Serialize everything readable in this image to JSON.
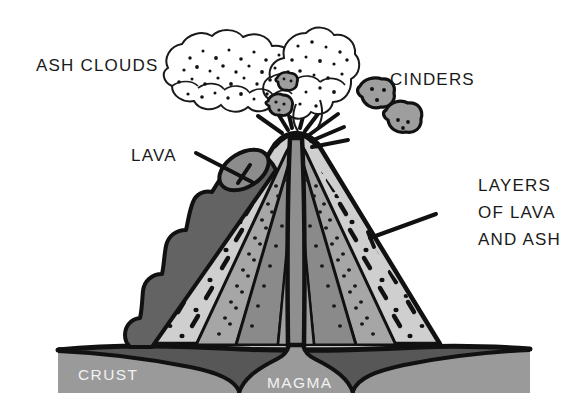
{
  "diagram": {
    "background_color": "#ffffff",
    "labels": {
      "ash_clouds": "ASH CLOUDS",
      "cinders": "CINDERS",
      "lava": "LAVA",
      "layers_line1": "LAYERS",
      "layers_line2": "OF LAVA",
      "layers_line3": "AND ASH",
      "crust": "CRUST",
      "magma": "MAGMA"
    },
    "colors": {
      "outline": "#111111",
      "background": "#ffffff",
      "crust_band": "#575757",
      "magma_chamber": "#9a9a9a",
      "lava_flow": "#636363",
      "layer_light": "#cfcfcf",
      "layer_medium": "#a6a6a6",
      "layer_dark": "#8a8a8a",
      "vent": "#8f8f8f",
      "cinder_fill": "#9e9e9e",
      "cloud_fill": "#ffffff",
      "label_text": "#1a1a1a",
      "inset_text": "#f2f2f2"
    },
    "parts": [
      {
        "name": "ash-clouds",
        "kind": "eruption-plume"
      },
      {
        "name": "cinders",
        "kind": "ejected-rock",
        "count": 4
      },
      {
        "name": "lava-flow",
        "kind": "surface-flow"
      },
      {
        "name": "layers-of-lava-and-ash",
        "kind": "stratified-cone"
      },
      {
        "name": "central-vent",
        "kind": "conduit"
      },
      {
        "name": "crust",
        "kind": "ground-layer"
      },
      {
        "name": "magma",
        "kind": "magma-chamber"
      }
    ]
  }
}
